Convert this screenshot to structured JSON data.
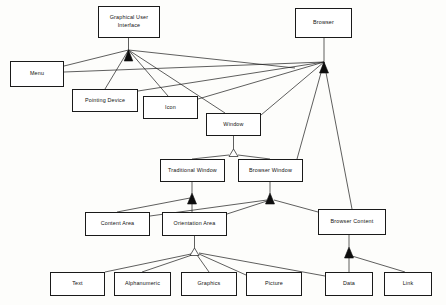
{
  "diagram": {
    "kind": "uml-class-generalization-diagram",
    "background_color": "#fdfdfb",
    "line_color": "#1a1a1a",
    "box_fill_color": "#ffffff",
    "nodes": [
      {
        "id": "gui",
        "label": "Graphical User\nInterface",
        "x": 98,
        "y": 6,
        "w": 62,
        "h": 32
      },
      {
        "id": "browser",
        "label": "Browser",
        "x": 295,
        "y": 8,
        "w": 57,
        "h": 30
      },
      {
        "id": "menu",
        "label": "Menu",
        "x": 10,
        "y": 61,
        "w": 54,
        "h": 26
      },
      {
        "id": "pointing-device",
        "label": "Pointing Device",
        "x": 72,
        "y": 89,
        "w": 66,
        "h": 23
      },
      {
        "id": "icon",
        "label": "Icon",
        "x": 143,
        "y": 96,
        "w": 55,
        "h": 23
      },
      {
        "id": "window",
        "label": "Window",
        "x": 206,
        "y": 113,
        "w": 55,
        "h": 23
      },
      {
        "id": "traditional-window",
        "label": "Traditional Window",
        "x": 160,
        "y": 159,
        "w": 65,
        "h": 23
      },
      {
        "id": "browser-window",
        "label": "Browser Window",
        "x": 238,
        "y": 159,
        "w": 65,
        "h": 23
      },
      {
        "id": "content-area",
        "label": "Content Area",
        "x": 85,
        "y": 212,
        "w": 65,
        "h": 24
      },
      {
        "id": "orientation-area",
        "label": "Orientation Area",
        "x": 162,
        "y": 212,
        "w": 65,
        "h": 24
      },
      {
        "id": "browser-content",
        "label": "Browser Content",
        "x": 318,
        "y": 209,
        "w": 68,
        "h": 26
      },
      {
        "id": "text",
        "label": "Text",
        "x": 50,
        "y": 272,
        "w": 55,
        "h": 24
      },
      {
        "id": "alphanumeric",
        "label": "Alphanumeric",
        "x": 114,
        "y": 272,
        "w": 57,
        "h": 24
      },
      {
        "id": "graphics",
        "label": "Graphics",
        "x": 181,
        "y": 272,
        "w": 56,
        "h": 24
      },
      {
        "id": "picture",
        "label": "Picture",
        "x": 246,
        "y": 272,
        "w": 56,
        "h": 24
      },
      {
        "id": "data",
        "label": "Data",
        "x": 325,
        "y": 272,
        "w": 48,
        "h": 24
      },
      {
        "id": "link",
        "label": "Link",
        "x": 384,
        "y": 272,
        "w": 48,
        "h": 24
      }
    ],
    "generalizations": [
      {
        "parent": "gui",
        "children": [
          "menu",
          "pointing-device",
          "icon",
          "window",
          "browser"
        ],
        "arrow": "filled"
      },
      {
        "parent": "browser",
        "children": [
          "menu",
          "icon",
          "window",
          "browser-window",
          "browser-content"
        ],
        "arrow": "filled"
      },
      {
        "parent": "window",
        "children": [
          "traditional-window",
          "browser-window"
        ],
        "arrow": "hollow"
      },
      {
        "parent": "traditional-window",
        "children": [
          "content-area",
          "orientation-area"
        ],
        "arrow": "filled"
      },
      {
        "parent": "browser-window",
        "children": [
          "content-area",
          "orientation-area",
          "browser-content"
        ],
        "arrow": "filled"
      },
      {
        "parent": "orientation-area",
        "children": [
          "text",
          "alphanumeric",
          "graphics",
          "picture",
          "data"
        ],
        "arrow": "hollow"
      },
      {
        "parent": "browser-content",
        "children": [
          "picture",
          "data",
          "link"
        ],
        "arrow": "filled"
      }
    ]
  }
}
